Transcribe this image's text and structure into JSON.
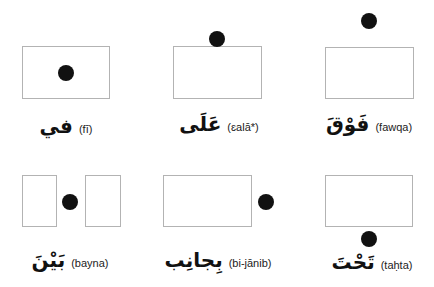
{
  "diagram": {
    "title": "",
    "colors": {
      "box_border": "#b3b3b3",
      "dot": "#111111",
      "text": "#111111"
    },
    "panels": [
      {
        "id": "fi",
        "arabic": "في",
        "transliteration": "(fī)",
        "meaning_position": "dot inside box"
      },
      {
        "id": "ala",
        "arabic": "عَلَى",
        "transliteration": "(ɛalā*)",
        "meaning_position": "dot on top of box"
      },
      {
        "id": "fawqa",
        "arabic": "فَوْقَ",
        "transliteration": "(fawqa)",
        "meaning_position": "dot above box"
      },
      {
        "id": "bayna",
        "arabic": "بَيْنَ",
        "transliteration": "(bayna)",
        "meaning_position": "dot between two boxes"
      },
      {
        "id": "bi-janib",
        "arabic": "بِجانِب",
        "transliteration": "(bi-jānib)",
        "meaning_position": "dot beside box"
      },
      {
        "id": "tahta",
        "arabic": "تَحْتَ",
        "transliteration": "(taḥta)",
        "meaning_position": "dot below box"
      }
    ]
  }
}
